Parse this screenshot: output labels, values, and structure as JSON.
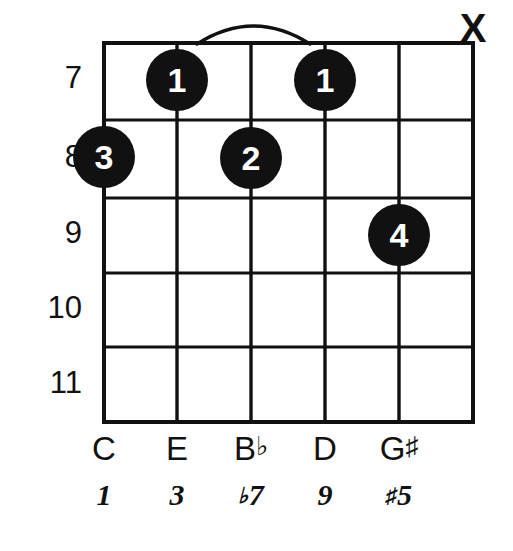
{
  "diagram": {
    "type": "guitar-chord-diagram",
    "title": "",
    "strings_shown": 6,
    "frets_shown": 5,
    "line_color": "#111111",
    "dot_color": "#111111",
    "dot_text_color": "#ffffff",
    "background_color": "#ffffff"
  },
  "fret_numbers": [
    {
      "label": "7",
      "y": 78
    },
    {
      "label": "8",
      "y": 157
    },
    {
      "label": "9",
      "y": 233
    },
    {
      "label": "10",
      "y": 308
    },
    {
      "label": "11",
      "y": 383
    }
  ],
  "string_markers": [
    {
      "name": "mute-marker-string-6",
      "label": "X",
      "x": 473,
      "y": 30
    }
  ],
  "finger_dots": [
    {
      "name": "finger-dot-1a",
      "finger": "1",
      "string_x": 177,
      "fret_y": 80
    },
    {
      "name": "finger-dot-1b",
      "finger": "1",
      "string_x": 325,
      "fret_y": 80
    },
    {
      "name": "finger-dot-3",
      "finger": "3",
      "string_x": 104,
      "fret_y": 157
    },
    {
      "name": "finger-dot-2",
      "finger": "2",
      "string_x": 251,
      "fret_y": 158
    },
    {
      "name": "finger-dot-4",
      "finger": "4",
      "string_x": 399,
      "fret_y": 235
    }
  ],
  "barre": {
    "present": true,
    "from_x": 197,
    "to_x": 310,
    "apex_y": 20,
    "base_y": 44
  },
  "note_row": [
    {
      "letter": "C",
      "accidental": "",
      "x": 104
    },
    {
      "letter": "E",
      "accidental": "",
      "x": 177
    },
    {
      "letter": "B",
      "accidental": "♭",
      "x": 251
    },
    {
      "letter": "D",
      "accidental": "",
      "x": 325
    },
    {
      "letter": "G",
      "accidental": "♯",
      "x": 399
    }
  ],
  "interval_row": [
    {
      "accidental": "",
      "degree": "1",
      "x": 104
    },
    {
      "accidental": "",
      "degree": "3",
      "x": 177
    },
    {
      "accidental": "♭",
      "degree": "7",
      "x": 251
    },
    {
      "accidental": "",
      "degree": "9",
      "x": 325
    },
    {
      "accidental": "♯",
      "degree": "5",
      "x": 399
    }
  ],
  "geometry": {
    "string_xs": [
      104,
      177,
      251,
      325,
      399,
      473
    ],
    "fret_ys": [
      43,
      120,
      198,
      273,
      347,
      422
    ],
    "dot_radius": 31,
    "note_row_y": 432,
    "interval_row_y": 480
  }
}
